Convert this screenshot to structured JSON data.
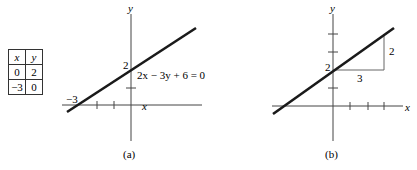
{
  "table": {
    "headers": [
      "x",
      "y"
    ],
    "rows": [
      [
        "0",
        "2"
      ],
      [
        "−3",
        "0"
      ]
    ]
  },
  "graph_a": {
    "caption": "(a)",
    "x_axis_label": "x",
    "y_axis_label": "y",
    "y_intercept_label": "2",
    "x_intercept_label": "−3",
    "equation": "2x − 3y + 6 = 0"
  },
  "graph_b": {
    "caption": "(b)",
    "x_axis_label": "x",
    "y_axis_label": "y",
    "y_intercept_label": "2",
    "rise_label": "2",
    "run_label": "3"
  },
  "colors": {
    "ink": "#1a1a1a",
    "thin": "#444444"
  }
}
